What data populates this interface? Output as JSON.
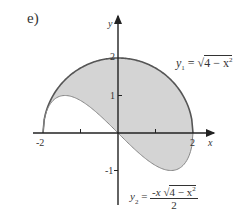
{
  "panel_label": "e)",
  "axes": {
    "x_label": "x",
    "y_label": "y",
    "x_ticks": [
      {
        "value": -2,
        "label": "-2"
      },
      {
        "value": -1,
        "label": ""
      },
      {
        "value": 1,
        "label": ""
      },
      {
        "value": 2,
        "label": "2"
      }
    ],
    "y_ticks": [
      {
        "value": 2,
        "label": "2"
      },
      {
        "value": 1,
        "label": "1"
      },
      {
        "value": -1,
        "label": "-1"
      }
    ]
  },
  "curves": {
    "upper": {
      "name": "y1",
      "lhs": "y",
      "subscript": "1",
      "rhs_radical": "4 − x",
      "rhs_power": "2"
    },
    "lower": {
      "name": "y2",
      "lhs": "y",
      "subscript": "2",
      "numerator_prefix": "-x ",
      "numerator_radical": "4 − x",
      "numerator_power": "2",
      "denominator": "2"
    }
  },
  "colors": {
    "fill": "#d4d4d4",
    "curve": "#555555",
    "axis": "#222222"
  }
}
